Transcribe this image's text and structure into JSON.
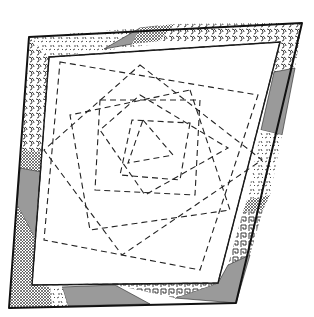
{
  "diagram": {
    "type": "quilt-block-pattern",
    "outer_corners": [
      [
        29,
        37
      ],
      [
        302,
        23
      ],
      [
        236,
        303
      ],
      [
        9,
        308
      ]
    ],
    "inner_corners": [
      [
        49,
        57
      ],
      [
        280,
        42
      ],
      [
        218,
        283
      ],
      [
        32,
        285
      ]
    ],
    "border_fabrics": [
      {
        "name": "speckle",
        "color": "#ffffff"
      },
      {
        "name": "swirl",
        "color": "#ffffff"
      },
      {
        "name": "crosshatch",
        "color": "#ffffff"
      },
      {
        "name": "greek-key",
        "color": "#ffffff"
      },
      {
        "name": "solid-grey",
        "color": "#9a9a9a"
      }
    ],
    "stitch_line_style": "dashed"
  }
}
